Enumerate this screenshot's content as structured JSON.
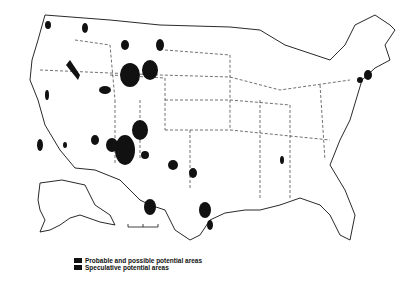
{
  "map": {
    "title": "",
    "region": "United States (conterminous, Alaska inset)",
    "colors": {
      "land_outline": "#111111",
      "potential_area": "#111111",
      "background": "#ffffff"
    },
    "scale_bar": {
      "visible": true,
      "label": ""
    }
  },
  "legend": {
    "items": [
      {
        "label": "Probable and possible potential areas",
        "swatch": "solid-black"
      },
      {
        "label": "Speculative potential areas",
        "swatch": "solid-black"
      }
    ]
  }
}
